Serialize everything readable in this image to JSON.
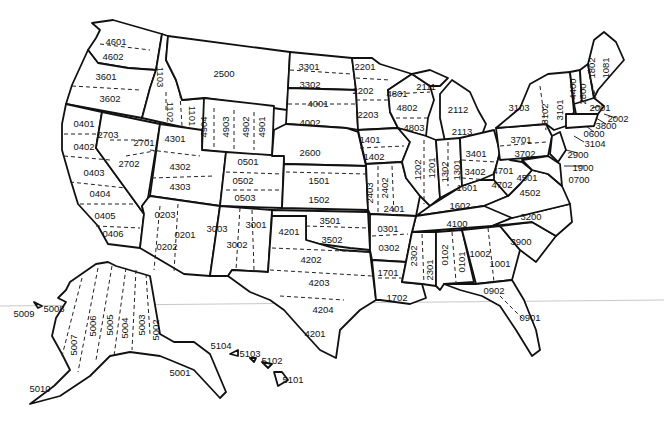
{
  "map": {
    "title": "State Plane Coordinate System Zones (NAD 27)",
    "contiguous_zones": [
      {
        "code": "4601",
        "x": 116,
        "y": 42
      },
      {
        "code": "4602",
        "x": 113,
        "y": 57
      },
      {
        "code": "3601",
        "x": 106,
        "y": 77
      },
      {
        "code": "3602",
        "x": 110,
        "y": 99
      },
      {
        "code": "1103",
        "x": 160,
        "y": 77,
        "rot": 90
      },
      {
        "code": "1102",
        "x": 170,
        "y": 112,
        "rot": 90
      },
      {
        "code": "1101",
        "x": 192,
        "y": 116,
        "rot": 90
      },
      {
        "code": "2500",
        "x": 224,
        "y": 74
      },
      {
        "code": "0401",
        "x": 84,
        "y": 124
      },
      {
        "code": "0402",
        "x": 84,
        "y": 147
      },
      {
        "code": "0403",
        "x": 94,
        "y": 173
      },
      {
        "code": "0404",
        "x": 100,
        "y": 194
      },
      {
        "code": "0405",
        "x": 105,
        "y": 216
      },
      {
        "code": "0406",
        "x": 113,
        "y": 234
      },
      {
        "code": "2703",
        "x": 108,
        "y": 135
      },
      {
        "code": "2701",
        "x": 144,
        "y": 143
      },
      {
        "code": "2702",
        "x": 129,
        "y": 164
      },
      {
        "code": "4301",
        "x": 175,
        "y": 139
      },
      {
        "code": "4302",
        "x": 180,
        "y": 167
      },
      {
        "code": "4303",
        "x": 180,
        "y": 187
      },
      {
        "code": "4904",
        "x": 204,
        "y": 127,
        "rot": -90
      },
      {
        "code": "4903",
        "x": 226,
        "y": 127,
        "rot": -90
      },
      {
        "code": "4902",
        "x": 246,
        "y": 127,
        "rot": -90
      },
      {
        "code": "4901",
        "x": 262,
        "y": 127,
        "rot": -90
      },
      {
        "code": "0501",
        "x": 248,
        "y": 162
      },
      {
        "code": "0502",
        "x": 243,
        "y": 181
      },
      {
        "code": "0503",
        "x": 245,
        "y": 198
      },
      {
        "code": "3301",
        "x": 309,
        "y": 67
      },
      {
        "code": "3302",
        "x": 310,
        "y": 85
      },
      {
        "code": "4001",
        "x": 318,
        "y": 104
      },
      {
        "code": "4002",
        "x": 310,
        "y": 123
      },
      {
        "code": "2600",
        "x": 310,
        "y": 153
      },
      {
        "code": "1501",
        "x": 319,
        "y": 181
      },
      {
        "code": "1502",
        "x": 319,
        "y": 200
      },
      {
        "code": "2201",
        "x": 365,
        "y": 67
      },
      {
        "code": "2202",
        "x": 363,
        "y": 91
      },
      {
        "code": "2203",
        "x": 368,
        "y": 115
      },
      {
        "code": "1401",
        "x": 370,
        "y": 140
      },
      {
        "code": "1402",
        "x": 374,
        "y": 157
      },
      {
        "code": "2403",
        "x": 370,
        "y": 193,
        "rot": -90
      },
      {
        "code": "2402",
        "x": 385,
        "y": 188,
        "rot": -90
      },
      {
        "code": "2401",
        "x": 394,
        "y": 209
      },
      {
        "code": "4801",
        "x": 397,
        "y": 94
      },
      {
        "code": "4802",
        "x": 407,
        "y": 108
      },
      {
        "code": "4803",
        "x": 414,
        "y": 128
      },
      {
        "code": "2111",
        "x": 426,
        "y": 87
      },
      {
        "code": "2112",
        "x": 458,
        "y": 110
      },
      {
        "code": "2113",
        "x": 462,
        "y": 132
      },
      {
        "code": "1202",
        "x": 418,
        "y": 170,
        "rot": -90
      },
      {
        "code": "1201",
        "x": 432,
        "y": 168,
        "rot": -90
      },
      {
        "code": "1302",
        "x": 445,
        "y": 172,
        "rot": -90
      },
      {
        "code": "1301",
        "x": 457,
        "y": 170,
        "rot": -90
      },
      {
        "code": "3401",
        "x": 476,
        "y": 154
      },
      {
        "code": "3402",
        "x": 475,
        "y": 172
      },
      {
        "code": "1601",
        "x": 467,
        "y": 188
      },
      {
        "code": "1602",
        "x": 460,
        "y": 206
      },
      {
        "code": "4701",
        "x": 503,
        "y": 171
      },
      {
        "code": "4702",
        "x": 502,
        "y": 185
      },
      {
        "code": "3701",
        "x": 521,
        "y": 140
      },
      {
        "code": "3702",
        "x": 525,
        "y": 154
      },
      {
        "code": "4501",
        "x": 527,
        "y": 178
      },
      {
        "code": "4502",
        "x": 530,
        "y": 193
      },
      {
        "code": "3103",
        "x": 519,
        "y": 108
      },
      {
        "code": "3102",
        "x": 545,
        "y": 114,
        "rot": -90
      },
      {
        "code": "3101",
        "x": 560,
        "y": 110,
        "rot": -90
      },
      {
        "code": "4400",
        "x": 573,
        "y": 89,
        "rot": -90
      },
      {
        "code": "2800",
        "x": 583,
        "y": 94,
        "rot": -90
      },
      {
        "code": "1802",
        "x": 592,
        "y": 68,
        "rot": -90
      },
      {
        "code": "1081",
        "x": 606,
        "y": 68,
        "rot": -90
      },
      {
        "code": "4100",
        "x": 457,
        "y": 224
      },
      {
        "code": "3200",
        "x": 531,
        "y": 217
      },
      {
        "code": "3900",
        "x": 521,
        "y": 242
      },
      {
        "code": "0301",
        "x": 388,
        "y": 229
      },
      {
        "code": "0302",
        "x": 389,
        "y": 248
      },
      {
        "code": "1701",
        "x": 388,
        "y": 273
      },
      {
        "code": "1702",
        "x": 397,
        "y": 298
      },
      {
        "code": "2302",
        "x": 414,
        "y": 256,
        "rot": -90
      },
      {
        "code": "2301",
        "x": 430,
        "y": 270,
        "rot": -90
      },
      {
        "code": "0102",
        "x": 445,
        "y": 255,
        "rot": -90
      },
      {
        "code": "0101",
        "x": 462,
        "y": 262,
        "rot": -90
      },
      {
        "code": "1002",
        "x": 480,
        "y": 254
      },
      {
        "code": "1001",
        "x": 500,
        "y": 264
      },
      {
        "code": "0902",
        "x": 494,
        "y": 291
      },
      {
        "code": "0901",
        "x": 530,
        "y": 318
      },
      {
        "code": "0203",
        "x": 165,
        "y": 215
      },
      {
        "code": "0201",
        "x": 185,
        "y": 235
      },
      {
        "code": "0202",
        "x": 167,
        "y": 247
      },
      {
        "code": "3003",
        "x": 217,
        "y": 229
      },
      {
        "code": "3002",
        "x": 237,
        "y": 245
      },
      {
        "code": "3001",
        "x": 256,
        "y": 225
      },
      {
        "code": "4201",
        "x": 289,
        "y": 232
      },
      {
        "code": "3501",
        "x": 330,
        "y": 221
      },
      {
        "code": "3502",
        "x": 332,
        "y": 240
      },
      {
        "code": "4202",
        "x": 311,
        "y": 260
      },
      {
        "code": "4203",
        "x": 319,
        "y": 283
      },
      {
        "code": "4204",
        "x": 323,
        "y": 310
      },
      {
        "code": "4201",
        "x": 315,
        "y": 334
      }
    ],
    "northeast_leaders": [
      {
        "code": "2001",
        "x": 600,
        "y": 108
      },
      {
        "code": "2002",
        "x": 618,
        "y": 119
      },
      {
        "code": "3800",
        "x": 606,
        "y": 126
      },
      {
        "code": "0600",
        "x": 594,
        "y": 134
      },
      {
        "code": "3104",
        "x": 595,
        "y": 144
      },
      {
        "code": "2900",
        "x": 578,
        "y": 155
      },
      {
        "code": "1900",
        "x": 583,
        "y": 168
      },
      {
        "code": "0700",
        "x": 579,
        "y": 180
      }
    ],
    "alaska_zones": [
      {
        "code": "5001",
        "x": 180,
        "y": 373
      },
      {
        "code": "5002",
        "x": 156,
        "y": 330,
        "rot": -90
      },
      {
        "code": "5003",
        "x": 142,
        "y": 325,
        "rot": -90
      },
      {
        "code": "5004",
        "x": 125,
        "y": 328,
        "rot": -90
      },
      {
        "code": "5005",
        "x": 110,
        "y": 325,
        "rot": -90
      },
      {
        "code": "5006",
        "x": 93,
        "y": 326,
        "rot": -90
      },
      {
        "code": "5007",
        "x": 74,
        "y": 345,
        "rot": -90
      },
      {
        "code": "5008",
        "x": 54,
        "y": 309
      },
      {
        "code": "5009",
        "x": 24,
        "y": 314
      },
      {
        "code": "5010",
        "x": 40,
        "y": 389
      }
    ],
    "hawaii_zones": [
      {
        "code": "5104",
        "x": 221,
        "y": 346
      },
      {
        "code": "5103",
        "x": 250,
        "y": 354
      },
      {
        "code": "5102",
        "x": 272,
        "y": 361
      },
      {
        "code": "5101",
        "x": 293,
        "y": 380
      }
    ]
  }
}
